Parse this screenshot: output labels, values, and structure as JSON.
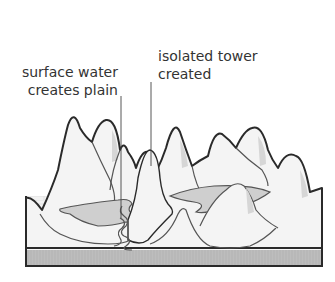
{
  "diagram": {
    "type": "karst-landscape-cross-section",
    "labels": [
      {
        "id": "surface",
        "lines": [
          "surface water",
          "creates plain"
        ]
      },
      {
        "id": "tower",
        "lines": [
          "isolated tower",
          "created"
        ]
      }
    ],
    "colors": {
      "outline": "#2a2a2a",
      "hill_fill": "#f4f4f4",
      "hill_shade": "#d2d2d2",
      "water": "#cfcfcf",
      "ground_band": "#b8b8b8",
      "brick_pattern": "#e2e2e2",
      "text": "#333333"
    }
  }
}
